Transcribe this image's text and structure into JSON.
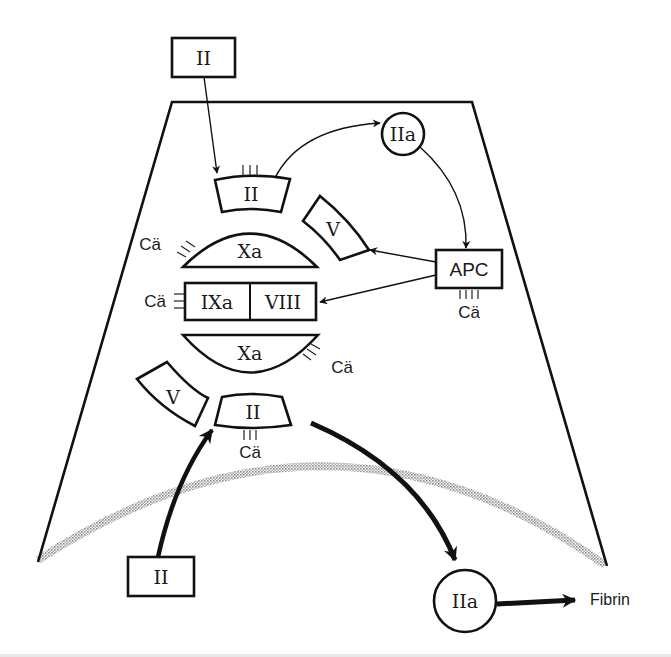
{
  "diagram": {
    "type": "coagulation-complex-schematic",
    "nodes": {
      "prothrombin_top": "II",
      "bound_prothrombin_top": "II",
      "thrombin_top": "IIa",
      "factor_v_upper": "V",
      "factor_xa_upper": "Xa",
      "apc": "APC",
      "factor_ixa": "IXa",
      "factor_viii": "VIII",
      "factor_xa_lower": "Xa",
      "factor_v_lower": "V",
      "bound_prothrombin_bottom": "II",
      "prothrombin_bottom": "II",
      "thrombin_bottom": "IIa",
      "fibrin": "Fibrin"
    },
    "calcium_labels": {
      "xa_upper": "Cä",
      "ixa": "Cä",
      "apc": "Cä",
      "xa_lower": "Cä",
      "ii_bottom": "Cä"
    },
    "edges": [
      {
        "from": "II (top box)",
        "to": "II (bound)",
        "weight": "thin"
      },
      {
        "from": "II (bound)",
        "to": "IIa (top)",
        "weight": "thin"
      },
      {
        "from": "IIa (top)",
        "to": "APC",
        "weight": "thin"
      },
      {
        "from": "APC",
        "to": "V (upper)",
        "weight": "thin"
      },
      {
        "from": "APC",
        "to": "VIII",
        "weight": "thin"
      },
      {
        "from": "II (bottom box)",
        "to": "II (bound bottom)",
        "weight": "thick"
      },
      {
        "from": "II (bound bottom)",
        "to": "IIa (bottom)",
        "weight": "thick"
      },
      {
        "from": "IIa (bottom)",
        "to": "Fibrin",
        "weight": "thick"
      }
    ],
    "colors": {
      "ink": "#111111",
      "membrane": "#9a9a9a"
    }
  }
}
